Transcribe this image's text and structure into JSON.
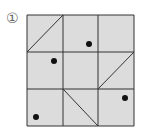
{
  "puzzle": {
    "label": "①",
    "grid": {
      "rows": 3,
      "cols": 3,
      "fill": "#dcdcdc",
      "line_color": "#333333"
    },
    "diagonals": [
      {
        "cell": [
          0,
          0
        ],
        "from": "bottom-left",
        "to": "top-right"
      },
      {
        "cell": [
          1,
          2
        ],
        "from": "bottom-left",
        "to": "top-right"
      },
      {
        "cell": [
          2,
          1
        ],
        "from": "top-left",
        "to": "bottom-right"
      }
    ],
    "dots": [
      {
        "cell": [
          0,
          1
        ],
        "pos": "right-bottom"
      },
      {
        "cell": [
          1,
          0
        ],
        "pos": "right-upper"
      },
      {
        "cell": [
          2,
          2
        ],
        "pos": "right-middle"
      },
      {
        "cell": [
          2,
          0
        ],
        "pos": "left-bottom"
      }
    ]
  }
}
